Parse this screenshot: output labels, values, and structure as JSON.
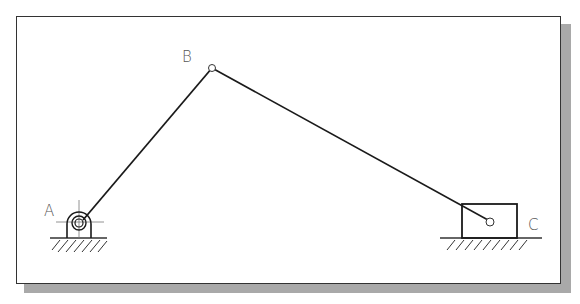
{
  "diagram": {
    "type": "slider-crank mechanism",
    "joints": [
      {
        "id": "A",
        "label": "A",
        "x": 79,
        "y": 248,
        "kind": "fixed-pivot"
      },
      {
        "id": "B",
        "label": "B",
        "x": 212,
        "y": 68,
        "kind": "revolute"
      },
      {
        "id": "C",
        "label": "C",
        "x": 490,
        "y": 222,
        "kind": "slider-pin"
      }
    ],
    "links": [
      {
        "from": "A",
        "to": "B",
        "name": "crank"
      },
      {
        "from": "B",
        "to": "C",
        "name": "coupler"
      }
    ],
    "labels": {
      "a": "A",
      "b": "B",
      "c": "C"
    },
    "colors": {
      "line": "#1a1a1a",
      "label": "#555555",
      "frame_border": "#333333",
      "shadow": "#a9a9a9",
      "background": "#ffffff"
    }
  }
}
